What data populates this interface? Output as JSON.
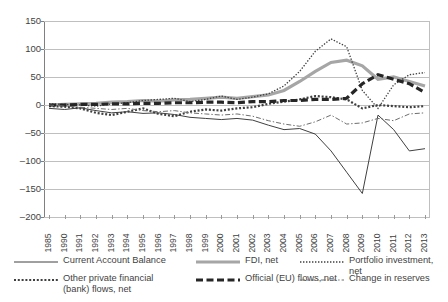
{
  "chart_data": {
    "type": "line",
    "title": "",
    "xlabel": "",
    "ylabel": "",
    "ylim": [
      -200,
      150
    ],
    "ytick_step": 50,
    "grid": true,
    "legend_position": "bottom",
    "categories": [
      "1985",
      "1990",
      "1991",
      "1992",
      "1993",
      "1994",
      "1995",
      "1996",
      "1997",
      "1998",
      "1999",
      "2000",
      "2001",
      "2002",
      "2003",
      "2004",
      "2005",
      "2006",
      "2007",
      "2008",
      "2009",
      "2010",
      "2011",
      "2012",
      "2013"
    ],
    "yticks": [
      "150",
      "100",
      "50",
      "0",
      "-50",
      "-100",
      "-150",
      "-200"
    ],
    "series": [
      {
        "name": "Current Account Balance",
        "style": "solid-thin",
        "color": "#404040",
        "values": [
          -6,
          -8,
          -5,
          -10,
          -14,
          -12,
          -15,
          -14,
          -17,
          -22,
          -24,
          -26,
          -24,
          -27,
          -36,
          -44,
          -42,
          -52,
          -82,
          -120,
          -158,
          -18,
          -44,
          -82,
          -78
        ]
      },
      {
        "name": "FDI, net",
        "style": "solid-thick-gray",
        "color": "#a6a6a6",
        "values": [
          0,
          1,
          2,
          3,
          5,
          6,
          8,
          7,
          9,
          10,
          12,
          14,
          12,
          15,
          18,
          26,
          42,
          60,
          76,
          80,
          70,
          46,
          50,
          42,
          34
        ]
      },
      {
        "name": "Portfolio investment, net",
        "style": "dotted-fine",
        "color": "#3f3f3f",
        "values": [
          2,
          1,
          0,
          -2,
          2,
          4,
          8,
          10,
          12,
          6,
          10,
          16,
          10,
          14,
          20,
          34,
          60,
          96,
          118,
          104,
          26,
          -6,
          36,
          54,
          58
        ]
      },
      {
        "name": "Other private financial (bank) flows, net",
        "style": "dotted-bold",
        "color": "#3f3f3f",
        "values": [
          -2,
          -3,
          -6,
          -14,
          -18,
          -12,
          -6,
          -16,
          -20,
          -12,
          -8,
          -10,
          -6,
          -4,
          2,
          6,
          10,
          16,
          14,
          10,
          -6,
          0,
          -2,
          -4,
          -2
        ]
      },
      {
        "name": "Official (EU) flows, net",
        "style": "dashed-thick",
        "color": "#262626",
        "values": [
          0,
          0,
          1,
          1,
          2,
          2,
          3,
          3,
          4,
          4,
          5,
          5,
          4,
          6,
          6,
          8,
          8,
          10,
          10,
          12,
          38,
          54,
          46,
          38,
          22
        ]
      },
      {
        "name": "Change in reserves",
        "style": "dashdot-thin",
        "color": "#6e6e6e",
        "values": [
          0,
          -2,
          -4,
          -6,
          -8,
          -6,
          -10,
          -12,
          -10,
          -14,
          -16,
          -18,
          -16,
          -20,
          -28,
          -34,
          -38,
          -30,
          -18,
          -34,
          -32,
          -24,
          -28,
          -16,
          -14
        ]
      }
    ],
    "legend_entries": [
      {
        "label": "Current Account Balance",
        "style": "solid-thin"
      },
      {
        "label": "FDI, net",
        "style": "solid-thick-gray"
      },
      {
        "label": "Portfolio investment, net",
        "style": "dotted-fine"
      },
      {
        "label": "Other private financial\n(bank) flows, net",
        "style": "dotted-bold"
      },
      {
        "label": "Official (EU) flows, net",
        "style": "dashed-thick"
      },
      {
        "label": "Change in reserves",
        "style": "dashdot-thin"
      }
    ]
  }
}
